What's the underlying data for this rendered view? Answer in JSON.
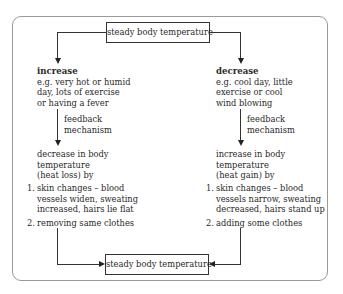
{
  "top_cut_text": "page (continued)",
  "top_node": {
    "label": "steady body temperature"
  },
  "bottom_node": {
    "label": "steady body temperature"
  },
  "left": {
    "heading": "increase",
    "example_lines": [
      "e.g. very hot or humid",
      "day, lots of exercise",
      "or having a fever"
    ],
    "feedback_lines": [
      "feedback",
      "mechanism"
    ],
    "response_lines": [
      "decrease in body",
      "temperature",
      "(heat loss) by"
    ],
    "steps": [
      {
        "num": "1.",
        "lines": [
          "skin changes – blood",
          "vessels widen, sweating",
          "increased, hairs lie flat"
        ]
      },
      {
        "num": "2.",
        "lines": [
          "removing same clothes"
        ]
      }
    ]
  },
  "right": {
    "heading": "decrease",
    "example_lines": [
      "e.g. cool day, little",
      "exercise or cool",
      "wind blowing"
    ],
    "feedback_lines": [
      "feedback",
      "mechanism"
    ],
    "response_lines": [
      "increase in body",
      "temperature",
      "(heat gain) by"
    ],
    "steps": [
      {
        "num": "1.",
        "lines": [
          "skin changes – blood",
          "vessels narrow, sweating",
          "decreased, hairs stand up"
        ]
      },
      {
        "num": "2.",
        "lines": [
          "adding some clothes"
        ]
      }
    ]
  },
  "colors": {
    "text": "#2a2a2a",
    "frame": "#9a9a9a",
    "line": "#333333"
  }
}
